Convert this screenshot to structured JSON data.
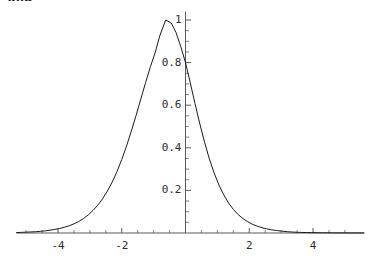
{
  "caption": {
    "text": "and"
  },
  "chart_data": {
    "type": "line",
    "title": "",
    "subtitle": "",
    "xlabel": "",
    "ylabel": "",
    "xlim": [
      -5.3,
      5.6
    ],
    "ylim": [
      0,
      1.06
    ],
    "grid": false,
    "legend": null,
    "x_ticks": [
      -4,
      -2,
      2,
      4
    ],
    "x_tick_labels": [
      "-4",
      "-2",
      "2",
      "4"
    ],
    "x_minor_ticks": [
      -5,
      -4.5,
      -3.5,
      -3,
      -2.5,
      -1.5,
      -1,
      -0.5,
      0.5,
      1,
      1.5,
      2.5,
      3,
      3.5,
      4.5,
      5
    ],
    "y_ticks": [
      0.2,
      0.4,
      0.6,
      0.8,
      1
    ],
    "y_tick_labels": [
      "0.2",
      "0.4",
      "0.6",
      "0.8",
      "1"
    ],
    "y_minor_ticks": [
      0.05,
      0.1,
      0.15,
      0.25,
      0.3,
      0.35,
      0.45,
      0.5,
      0.55,
      0.65,
      0.7,
      0.75,
      0.85,
      0.9,
      0.95
    ],
    "axis_color": "#595959",
    "line_color": "#1a1a1a",
    "line_width": 1.0,
    "background": "#ffffff",
    "peak": {
      "x": -0.62,
      "y": 1.0
    },
    "value_at_zero": 0.8,
    "series": [
      {
        "name": "curve",
        "x": [
          -5.3,
          -5.15,
          -5.0,
          -4.85,
          -4.7,
          -4.55,
          -4.4,
          -4.25,
          -4.1,
          -3.95,
          -3.8,
          -3.65,
          -3.5,
          -3.35,
          -3.2,
          -3.05,
          -2.9,
          -2.75,
          -2.6,
          -2.45,
          -2.3,
          -2.15,
          -2.0,
          -1.85,
          -1.7,
          -1.55,
          -1.4,
          -1.25,
          -1.1,
          -0.95,
          -0.8,
          -0.62,
          -0.45,
          -0.3,
          -0.15,
          0.0,
          0.15,
          0.3,
          0.45,
          0.6,
          0.75,
          0.9,
          1.05,
          1.2,
          1.35,
          1.5,
          1.65,
          1.8,
          1.95,
          2.1,
          2.25,
          2.4,
          2.55,
          2.7,
          2.85,
          3.0,
          3.2,
          3.4,
          3.6,
          3.8,
          4.0,
          4.3,
          4.6,
          5.0,
          5.3,
          5.6
        ],
        "y": [
          0.002,
          0.003,
          0.004,
          0.005,
          0.006,
          0.008,
          0.01,
          0.013,
          0.017,
          0.021,
          0.027,
          0.034,
          0.043,
          0.054,
          0.068,
          0.085,
          0.106,
          0.131,
          0.161,
          0.197,
          0.239,
          0.288,
          0.345,
          0.408,
          0.478,
          0.552,
          0.63,
          0.707,
          0.781,
          0.848,
          0.929,
          1.0,
          0.986,
          0.942,
          0.876,
          0.8,
          0.705,
          0.607,
          0.512,
          0.425,
          0.347,
          0.281,
          0.225,
          0.179,
          0.141,
          0.111,
          0.087,
          0.068,
          0.053,
          0.041,
          0.032,
          0.025,
          0.019,
          0.015,
          0.012,
          0.009,
          0.006,
          0.004,
          0.003,
          0.002,
          0.0015,
          0.001,
          0.0007,
          0.0004,
          0.0003,
          0.0002
        ]
      }
    ]
  }
}
